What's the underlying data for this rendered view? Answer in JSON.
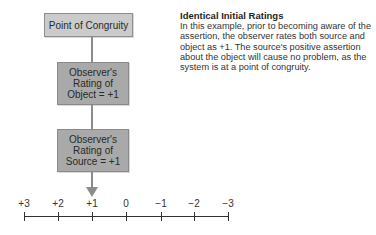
{
  "diagram": {
    "boxes": {
      "congruity": "Point of Congruity",
      "object": "Observer's\nRating of\nObject = +1",
      "source": "Observer's\nRating of\nSource = +1"
    },
    "arrow_points_to": "+1",
    "scale": {
      "ticks": [
        "+3",
        "+2",
        "+1",
        "0",
        "−1",
        "−2",
        "−3"
      ]
    }
  },
  "description": {
    "title": "Identical Initial Ratings",
    "body": "In this example, prior to becoming aware of the assertion, the observer rates both source and object as +1. The source's positive assertion about the object will cause no problem, as the system is at a point of congruity."
  },
  "colors": {
    "box_light": "#cbcbcb",
    "box_dark": "#a9a9a9",
    "connector": "#8c8c8c",
    "axis": "#333333"
  }
}
